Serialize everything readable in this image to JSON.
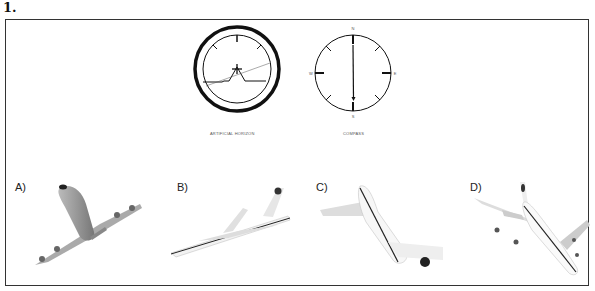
{
  "question": {
    "number": "1."
  },
  "instruments": {
    "horizon": {
      "caption": "ARTIFICIAL HORIZON"
    },
    "compass": {
      "caption": "COMPASS",
      "n": "N",
      "s": "S",
      "e": "E",
      "w": "W"
    }
  },
  "options": [
    {
      "label": "A)",
      "description": "airliner viewed from below, banking left, nose up"
    },
    {
      "label": "B)",
      "description": "airliner side view, climbing, banked"
    },
    {
      "label": "C)",
      "description": "airliner viewed from above, diving right"
    },
    {
      "label": "D)",
      "description": "airliner viewed from above, heading toward viewer, banking"
    }
  ]
}
